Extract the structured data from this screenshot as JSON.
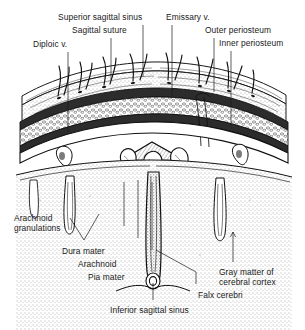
{
  "figure": {
    "background_color": "#ffffff",
    "ink_color": "#1a1a1a",
    "style": "black-and-white pen-and-ink anatomical line drawing with stippled shading"
  },
  "labels": [
    {
      "id": "superior-sagittal-sinus",
      "text": "Superior sagittal sinus"
    },
    {
      "id": "sagittal-suture",
      "text": "Sagittal suture"
    },
    {
      "id": "diploic-v",
      "text": "Diploic v."
    },
    {
      "id": "emissary-v",
      "text": "Emissary v."
    },
    {
      "id": "outer-periosteum",
      "text": "Outer periosteum"
    },
    {
      "id": "inner-periosteum",
      "text": "Inner periosteum"
    },
    {
      "id": "arachnoid-granulations",
      "text": "Arachnoid",
      "text2": "granulations"
    },
    {
      "id": "dura-mater",
      "text": "Dura mater"
    },
    {
      "id": "arachnoid",
      "text": "Arachnoid"
    },
    {
      "id": "pia-mater",
      "text": "Pia mater"
    },
    {
      "id": "gray-matter",
      "text": "Gray matter of",
      "text2": "cerebral cortex"
    },
    {
      "id": "falx-cerebri",
      "text": "Falx cerebri"
    },
    {
      "id": "inferior-sagittal-sinus",
      "text": "Inferior sagittal sinus"
    }
  ],
  "structures": [
    "scalp skin with hair shafts and follicles",
    "subcutaneous connective tissue",
    "outer table of skull",
    "diploe with diploic veins",
    "inner table of skull",
    "dura mater",
    "superior sagittal sinus lumen",
    "arachnoid granulations",
    "subarachnoid space",
    "falx cerebri",
    "inferior sagittal sinus",
    "cerebral cortex gray matter",
    "cerebral sulci"
  ]
}
